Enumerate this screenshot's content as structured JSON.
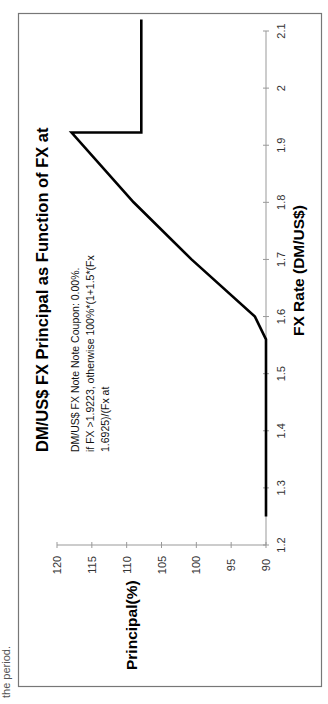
{
  "page": {
    "caption_fragment": "the period."
  },
  "chart_data": {
    "type": "line",
    "title": "DM/US$ FX Principal as Function of FX at",
    "subtitle_lines": [
      "DM/US$ FX Note Note Coupon: 0.00%.",
      "if FX >1.9223, otherwise 100%*(1+1.5*(Fx",
      "1.6925)/(Fx at"
    ],
    "xlabel": "FX Rate (DM/US$)",
    "ylabel": "Principal(%)",
    "xlim": [
      1.2,
      2.1
    ],
    "ylim": [
      90,
      120
    ],
    "xticks": [
      "1.2",
      "1.3",
      "1.4",
      "1.5",
      "1.6",
      "1.7",
      "1.8",
      "1.9",
      "2",
      "2.1"
    ],
    "yticks": [
      "90",
      "95",
      "100",
      "105",
      "110",
      "115",
      "120"
    ],
    "grid": false,
    "legend": "none",
    "orientation": "rotated-90-ccw",
    "series": [
      {
        "name": "Principal",
        "color": "#000000",
        "x": [
          1.25,
          1.56,
          1.6,
          1.7,
          1.8,
          1.9223,
          1.9223,
          2.12
        ],
        "y": [
          90,
          90,
          91.6,
          100.7,
          109.0,
          117.9,
          107.9,
          107.9
        ]
      }
    ]
  }
}
